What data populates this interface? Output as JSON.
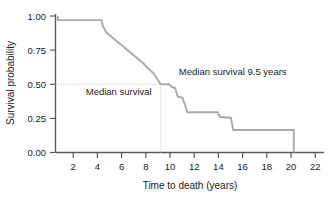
{
  "chart_data": {
    "type": "line",
    "title": "",
    "xlabel": "Time to death (years)",
    "ylabel": "Survival probability",
    "xlim": [
      0.8,
      23
    ],
    "ylim": [
      0.0,
      1.0
    ],
    "grid": false,
    "legend": null,
    "xticks": [
      2,
      4,
      6,
      8,
      10,
      12,
      14,
      16,
      18,
      20,
      22
    ],
    "xtick_labels": [
      "2",
      "4",
      "6",
      "8",
      "10",
      "12",
      "14",
      "16",
      "18",
      "20",
      "22"
    ],
    "yticks": [
      0.0,
      0.25,
      0.5,
      0.75,
      1.0
    ],
    "ytick_labels": [
      "0.00",
      "0.25",
      "0.50",
      "0.75",
      "1.00"
    ],
    "series": [
      {
        "name": "Kaplan-Meier survival curve",
        "style": "step",
        "color": "#a9a9a9",
        "x": [
          1.0,
          1.0,
          4.6,
          4.7,
          5.0,
          8.1,
          8.3,
          8.9,
          9.5,
          10.2,
          10.4,
          10.7,
          10.9,
          11.3,
          11.5,
          11.7,
          14.2,
          14.4,
          15.3,
          15.5,
          20.5,
          20.5
        ],
        "y": [
          1.0,
          0.97,
          0.97,
          0.93,
          0.88,
          0.65,
          0.63,
          0.58,
          0.5,
          0.5,
          0.48,
          0.47,
          0.41,
          0.4,
          0.35,
          0.295,
          0.295,
          0.26,
          0.255,
          0.165,
          0.165,
          0.0
        ]
      }
    ],
    "annotations": [
      {
        "name": "median-survival-label",
        "text": "Median survival",
        "x": 3.3,
        "y": 0.42
      },
      {
        "name": "median-survival-value-label",
        "text": "Median survival 9.5 years",
        "x": 11.0,
        "y": 0.565
      }
    ],
    "reference_lines": [
      {
        "name": "median-horizontal-reference",
        "orientation": "horizontal",
        "value": 0.5,
        "from": 0.8,
        "to": 9.5,
        "style": "dotted",
        "color": "#c4c4c4"
      },
      {
        "name": "median-vertical-reference",
        "orientation": "vertical",
        "value": 9.5,
        "from": 0.0,
        "to": 0.5,
        "style": "dotted",
        "color": "#c4c4c4"
      }
    ],
    "median_survival_years": 9.5,
    "axis_color": "#5a5a5a"
  }
}
